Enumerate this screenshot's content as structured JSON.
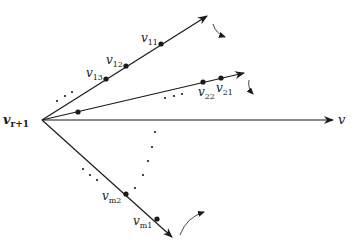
{
  "colors": {
    "ink": "#1a1a1a",
    "background": "#ffffff"
  },
  "origin": {
    "label": "v",
    "subscript": "r+1",
    "x": 42,
    "y": 120
  },
  "axis": {
    "label": "v",
    "tip": [
      333,
      120
    ]
  },
  "rays": [
    {
      "id": "ray-1",
      "tip": [
        207,
        16
      ],
      "rotation_arrow": {
        "from": [
          213,
          24
        ],
        "to": [
          225,
          37
        ],
        "direction": "clockwise"
      },
      "points": [
        {
          "label": "v",
          "subscript": "11",
          "x": 161,
          "y": 44
        },
        {
          "label": "v",
          "subscript": "12",
          "x": 126,
          "y": 66
        },
        {
          "label": "v",
          "subscript": "13",
          "x": 106,
          "y": 79
        }
      ]
    },
    {
      "id": "ray-2",
      "tip": [
        244,
        73
      ],
      "rotation_arrow": {
        "from": [
          249,
          80
        ],
        "to": [
          253,
          94
        ],
        "direction": "clockwise"
      },
      "points": [
        {
          "label": "v",
          "subscript": "21",
          "x": 221,
          "y": 78
        },
        {
          "label": "v",
          "subscript": "22",
          "x": 203,
          "y": 82
        },
        {
          "label": "",
          "subscript": "",
          "x": 78,
          "y": 112
        }
      ]
    },
    {
      "id": "ray-m",
      "tip": [
        172,
        237
      ],
      "rotation_arrow": {
        "from": [
          180,
          235
        ],
        "to": [
          204,
          212
        ],
        "direction": "counterclockwise"
      },
      "points": [
        {
          "label": "v",
          "subscript": "m1",
          "x": 157,
          "y": 219
        },
        {
          "label": "v",
          "subscript": "m2",
          "x": 126,
          "y": 194
        }
      ]
    }
  ],
  "ellipses": [
    {
      "id": "between-ray1-ray2",
      "dots": [
        [
          57,
          101
        ],
        [
          65,
          96
        ],
        [
          72,
          92
        ]
      ]
    },
    {
      "id": "below-ray2",
      "dots": [
        [
          165,
          98
        ],
        [
          174,
          96
        ],
        [
          182,
          94
        ]
      ]
    },
    {
      "id": "near-ray-m",
      "dots": [
        [
          83,
          169
        ],
        [
          90,
          175
        ],
        [
          97,
          180
        ]
      ]
    },
    {
      "id": "arc-to-ray-m",
      "dots": [
        [
          155,
          132
        ],
        [
          152,
          147
        ],
        [
          148,
          161
        ],
        [
          143,
          175
        ],
        [
          135,
          188
        ]
      ]
    }
  ]
}
